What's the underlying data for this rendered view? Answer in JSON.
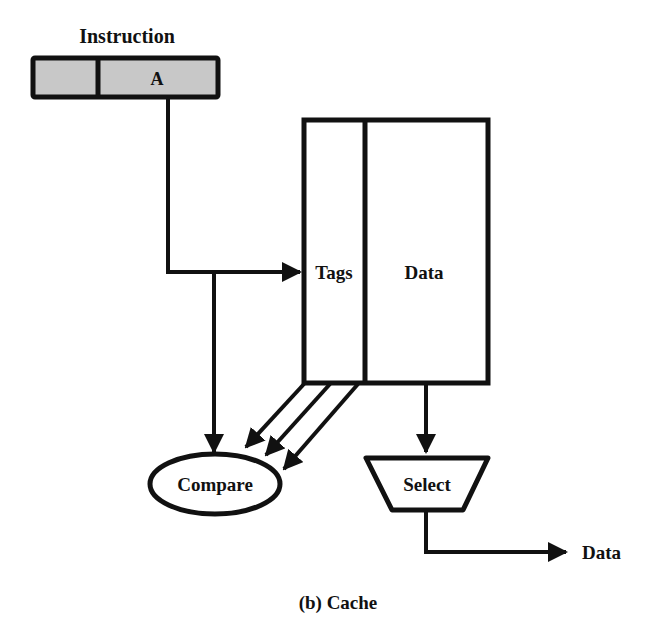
{
  "diagram": {
    "instruction_label": "Instruction",
    "instruction_field": "A",
    "tags_label": "Tags",
    "data_label": "Data",
    "compare_label": "Compare",
    "select_label": "Select",
    "output_label": "Data",
    "caption": "(b) Cache",
    "colors": {
      "stroke": "#111111",
      "field_fill": "#c8c8c8",
      "background": "#ffffff"
    }
  }
}
